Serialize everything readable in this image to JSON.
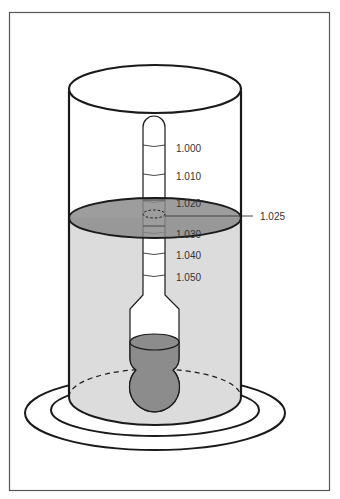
{
  "diagram": {
    "scale_labels": [
      {
        "text": "1.000",
        "y": 148
      },
      {
        "text": "1.010",
        "y": 176
      },
      {
        "text": "1.020",
        "y": 203
      },
      {
        "text": "1.030",
        "y": 234
      },
      {
        "text": "1.040",
        "y": 255
      },
      {
        "text": "1.050",
        "y": 277
      }
    ],
    "reading_label": "1.025",
    "colors": {
      "liquid": "#dcdcdc",
      "liquid_surface": "#8c8c8c",
      "bulb": "#8c8c8c",
      "stroke": "#1a1a1a",
      "frame": "#555555"
    }
  }
}
